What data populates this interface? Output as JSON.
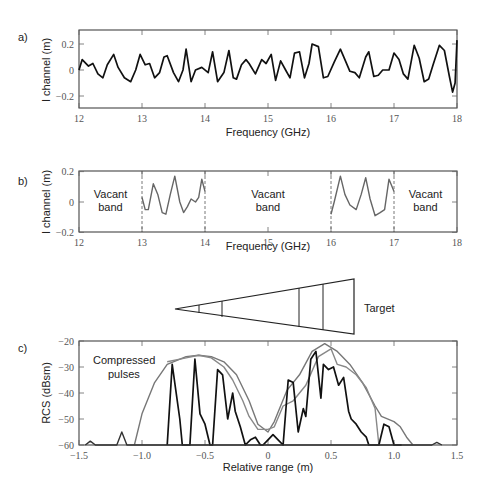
{
  "figure": {
    "panels": [
      {
        "id": "a",
        "label": "a)"
      },
      {
        "id": "b",
        "label": "b)"
      },
      {
        "id": "c",
        "label": "c)"
      }
    ],
    "target_label": "Target",
    "compressed_label_line1": "Compressed",
    "compressed_label_line2": "pulses",
    "vacant_band": {
      "line1": "Vacant",
      "line2": "band"
    }
  },
  "chart_data": [
    {
      "panel": "a",
      "type": "line",
      "title": "",
      "xlabel": "Frequency (GHz)",
      "ylabel": "I channel (m)",
      "xlim": [
        12,
        18
      ],
      "ylim": [
        -0.3,
        0.3
      ],
      "xticks": [
        12,
        13,
        14,
        15,
        16,
        17,
        18
      ],
      "yticks": [
        0.2,
        0,
        -0.2
      ],
      "ytick_labels": [
        "0.2",
        "0",
        "-0.2"
      ],
      "grid": false,
      "series": [
        {
          "name": "I channel",
          "color": "#111111",
          "x": [
            12.0,
            12.05,
            12.15,
            12.22,
            12.3,
            12.38,
            12.45,
            12.55,
            12.62,
            12.72,
            12.82,
            12.9,
            12.97,
            13.05,
            13.12,
            13.2,
            13.28,
            13.35,
            13.4,
            13.5,
            13.58,
            13.65,
            13.7,
            13.78,
            13.85,
            13.95,
            14.05,
            14.12,
            14.2,
            14.3,
            14.38,
            14.45,
            14.5,
            14.58,
            14.65,
            14.7,
            14.8,
            14.9,
            14.97,
            15.05,
            15.12,
            15.2,
            15.28,
            15.35,
            15.42,
            15.5,
            15.58,
            15.65,
            15.7,
            15.8,
            15.88,
            15.95,
            16.05,
            16.15,
            16.22,
            16.3,
            16.38,
            16.45,
            16.55,
            16.6,
            16.68,
            16.75,
            16.82,
            16.92,
            17.0,
            17.08,
            17.15,
            17.22,
            17.32,
            17.4,
            17.48,
            17.55,
            17.62,
            17.72,
            17.8,
            17.88,
            17.93,
            17.97,
            18.0
          ],
          "y": [
            0.0,
            0.08,
            0.03,
            0.05,
            -0.03,
            -0.06,
            0.04,
            0.12,
            0.02,
            -0.06,
            -0.09,
            0.0,
            0.12,
            0.04,
            0.05,
            -0.06,
            -0.02,
            0.1,
            0.11,
            -0.02,
            -0.09,
            0.0,
            0.16,
            -0.09,
            0.0,
            0.02,
            -0.02,
            0.14,
            -0.09,
            -0.02,
            0.15,
            -0.06,
            -0.07,
            0.04,
            0.08,
            0.05,
            -0.03,
            0.08,
            0.05,
            0.12,
            -0.08,
            0.07,
            0.0,
            -0.06,
            0.13,
            0.14,
            -0.06,
            0.05,
            0.2,
            0.18,
            -0.06,
            -0.05,
            0.06,
            0.16,
            0.08,
            -0.01,
            -0.02,
            -0.06,
            0.1,
            0.14,
            -0.05,
            -0.04,
            0.0,
            0.0,
            0.13,
            0.08,
            -0.03,
            -0.07,
            0.19,
            0.09,
            -0.09,
            -0.07,
            0.04,
            0.19,
            0.15,
            -0.05,
            -0.17,
            -0.1,
            0.23
          ]
        }
      ]
    },
    {
      "panel": "b",
      "type": "line",
      "title": "",
      "xlabel": "Frequency (GHz)",
      "ylabel": "I channel (m)",
      "xlim": [
        12,
        18
      ],
      "ylim": [
        -0.2,
        0.2
      ],
      "xticks": [
        12,
        13,
        14,
        15,
        16,
        17,
        18
      ],
      "yticks": [
        0.2,
        0,
        -0.2
      ],
      "ytick_labels": [
        "0.2",
        "0",
        "-0.2"
      ],
      "grid": false,
      "band_markers": [
        13,
        14,
        16,
        17
      ],
      "annotations": [
        {
          "text": "Vacant band",
          "x": 12.5
        },
        {
          "text": "Vacant band",
          "x": 15.0
        },
        {
          "text": "Vacant band",
          "x": 17.5
        }
      ],
      "series": [
        {
          "name": "I channel (13-14 GHz)",
          "color": "#666666",
          "x": [
            13.0,
            13.05,
            13.1,
            13.18,
            13.25,
            13.32,
            13.38,
            13.45,
            13.52,
            13.6,
            13.66,
            13.72,
            13.78,
            13.85,
            13.9,
            13.95,
            14.0
          ],
          "y": [
            0.03,
            -0.05,
            -0.05,
            0.12,
            0.05,
            -0.07,
            -0.08,
            0.05,
            0.17,
            0.0,
            -0.07,
            -0.03,
            0.02,
            0.0,
            0.03,
            0.15,
            0.07
          ]
        },
        {
          "name": "I channel (16-17 GHz)",
          "color": "#666666",
          "x": [
            16.0,
            16.05,
            16.15,
            16.22,
            16.3,
            16.4,
            16.48,
            16.55,
            16.62,
            16.7,
            16.78,
            16.85,
            16.92,
            16.97,
            17.0
          ],
          "y": [
            -0.08,
            0.0,
            0.17,
            0.05,
            -0.02,
            -0.05,
            0.05,
            0.16,
            0.02,
            -0.09,
            -0.07,
            -0.05,
            0.15,
            0.1,
            0.07
          ]
        }
      ]
    },
    {
      "panel": "c",
      "type": "line",
      "title": "",
      "xlabel": "Relative range (m)",
      "ylabel": "RCS (dBsm)",
      "xlim": [
        -1.5,
        1.5
      ],
      "ylim": [
        -60,
        -20
      ],
      "xticks": [
        -1.5,
        -1.0,
        -0.5,
        0,
        0.5,
        1.0,
        1.5
      ],
      "xtick_labels": [
        "-1.5",
        "-1.0",
        "-0.5",
        "0",
        "0.5",
        "1.0",
        "1.5"
      ],
      "yticks": [
        -20,
        -30,
        -40,
        -50,
        -60
      ],
      "grid": false,
      "series": [
        {
          "name": "Full-band compressed pulse (envelope 1)",
          "color": "#777777",
          "x": [
            -1.06,
            -1.0,
            -0.9,
            -0.8,
            -0.65,
            -0.55,
            -0.45,
            -0.35,
            -0.25,
            -0.15,
            -0.08,
            0.0,
            0.05,
            0.15,
            0.25,
            0.35,
            0.45,
            0.55,
            0.65,
            0.75,
            0.85,
            0.9,
            1.0,
            1.05,
            1.1,
            1.15
          ],
          "y": [
            -60,
            -48,
            -36,
            -29,
            -26,
            -25.5,
            -26,
            -28,
            -33,
            -43,
            -52,
            -55,
            -51,
            -39,
            -33,
            -24,
            -21,
            -24,
            -29,
            -36,
            -45,
            -49,
            -51,
            -53,
            -57,
            -60
          ]
        },
        {
          "name": "Full-band compressed pulse (envelope 2)",
          "color": "#888888",
          "x": [
            -0.8,
            -0.65,
            -0.55,
            -0.45,
            -0.35,
            -0.28,
            -0.2,
            -0.15,
            -0.08,
            0.0,
            0.05,
            0.12,
            0.2,
            0.3,
            0.4,
            0.5,
            0.55,
            0.62,
            0.7,
            0.78,
            0.85,
            0.88
          ],
          "y": [
            -28,
            -26.5,
            -25.5,
            -26.5,
            -30,
            -35,
            -43,
            -49,
            -54,
            -54,
            -53,
            -45,
            -43,
            -37,
            -26,
            -23,
            -29,
            -30,
            -33,
            -38,
            -46,
            -60
          ]
        },
        {
          "name": "Gapped-band compressed pulse",
          "color": "#111111",
          "x": [
            -0.8,
            -0.76,
            -0.7,
            -0.68,
            -0.62,
            -0.58,
            -0.54,
            -0.5,
            -0.46,
            -0.44,
            -0.4,
            -0.36,
            -0.32,
            -0.28,
            -0.26,
            -0.22,
            -0.18,
            -0.14,
            -0.1,
            -0.06,
            -0.04,
            0.0,
            0.04,
            0.08,
            0.12,
            0.16,
            0.2,
            0.24,
            0.28,
            0.3,
            0.34,
            0.38,
            0.42,
            0.44,
            0.48,
            0.52,
            0.56,
            0.6,
            0.64,
            0.66,
            0.7,
            0.74,
            0.78,
            0.8,
            0.84,
            0.88,
            0.92,
            0.96,
            1.0,
            1.02,
            1.06
          ],
          "y": [
            -60,
            -29,
            -50,
            -60,
            -60,
            -27,
            -48,
            -52,
            -60,
            -60,
            -31,
            -33,
            -50,
            -40,
            -47,
            -53,
            -60,
            -58,
            -57,
            -60,
            -60,
            -58,
            -56,
            -58,
            -60,
            -35,
            -36,
            -55,
            -46,
            -49,
            -27,
            -24,
            -42,
            -29,
            -31,
            -30,
            -37,
            -34,
            -47,
            -50,
            -52,
            -55,
            -57,
            -60,
            -60,
            -60,
            -52,
            -53,
            -60,
            -60,
            -60
          ]
        },
        {
          "name": "Sidelobes",
          "color": "#333333",
          "x": [
            -1.45,
            -1.41,
            -1.37,
            -1.2,
            -1.16,
            -1.12,
            1.3,
            1.34,
            1.38
          ],
          "y": [
            -60,
            -58.5,
            -60,
            -60,
            -55,
            -60,
            -60,
            -59,
            -60
          ]
        }
      ]
    }
  ]
}
